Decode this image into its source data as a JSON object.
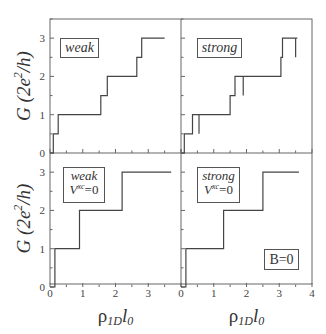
{
  "chart_data": {
    "type": "line",
    "layout": "2x2 panels sharing axes",
    "ylabel": "G (2e^2/h)",
    "xlabel": "ρ1D l0",
    "xlim": [
      0,
      4
    ],
    "ylim": [
      0,
      3.5
    ],
    "xticks": [
      0,
      1,
      2,
      3,
      4
    ],
    "yticks": [
      0,
      1,
      2,
      3
    ],
    "grid": false,
    "panels": [
      {
        "position": "top-left",
        "label": "weak",
        "steps": [
          [
            0,
            0
          ],
          [
            0.1,
            0
          ],
          [
            0.1,
            0.5
          ],
          [
            0.25,
            0.5
          ],
          [
            0.25,
            1
          ],
          [
            1.55,
            1
          ],
          [
            1.55,
            1.5
          ],
          [
            1.75,
            1.5
          ],
          [
            1.75,
            2
          ],
          [
            2.65,
            2
          ],
          [
            2.65,
            2.5
          ],
          [
            2.8,
            2.5
          ],
          [
            2.8,
            3
          ],
          [
            3.5,
            3
          ]
        ]
      },
      {
        "position": "top-right",
        "label": "strong",
        "steps": [
          [
            0,
            0
          ],
          [
            0.1,
            0
          ],
          [
            0.1,
            0.5
          ],
          [
            0.35,
            0.5
          ],
          [
            0.35,
            1
          ],
          [
            1.5,
            1
          ],
          [
            1.5,
            1.5
          ],
          [
            1.65,
            1.5
          ],
          [
            1.65,
            2
          ],
          [
            3.05,
            2
          ],
          [
            3.05,
            2.5
          ],
          [
            3.1,
            2.5
          ],
          [
            3.1,
            3
          ],
          [
            3.55,
            3
          ]
        ],
        "spikes": [
          {
            "x": 0.55,
            "from": 1,
            "to": 0.5
          },
          {
            "x": 1.9,
            "from": 2,
            "to": 1.5
          },
          {
            "x": 3.5,
            "from": 3,
            "to": 2.5
          }
        ]
      },
      {
        "position": "bottom-left",
        "label": "weak",
        "label2": "V^xc=0",
        "steps": [
          [
            0,
            0
          ],
          [
            0.15,
            0
          ],
          [
            0.15,
            1
          ],
          [
            0.9,
            1
          ],
          [
            0.9,
            2
          ],
          [
            2.2,
            2
          ],
          [
            2.2,
            3
          ],
          [
            3.7,
            3
          ]
        ]
      },
      {
        "position": "bottom-right",
        "label": "strong",
        "label2": "V^xc=0",
        "extra_label": "B=0",
        "steps": [
          [
            0,
            0
          ],
          [
            0.15,
            0
          ],
          [
            0.15,
            1
          ],
          [
            1.3,
            1
          ],
          [
            1.3,
            2
          ],
          [
            2.5,
            2
          ],
          [
            2.5,
            3
          ],
          [
            3.6,
            3
          ]
        ]
      }
    ]
  },
  "labels": {
    "ytick_0": "0",
    "ytick_1": "1",
    "ytick_2": "2",
    "ytick_3": "3",
    "xtick_0": "0",
    "xtick_1": "1",
    "xtick_2": "2",
    "xtick_3": "3",
    "xtick_4": "4",
    "weak": "weak",
    "strong": "strong",
    "vxc_v": "V",
    "vxc_sup": "xc",
    "vxc_eq": "=0",
    "b0": "B=0"
  }
}
